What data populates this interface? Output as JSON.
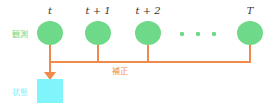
{
  "diagram": {
    "observation_label": "観測",
    "correction_label": "補正",
    "state_label": "状態",
    "time_steps": [
      "t",
      "t + 1",
      "t + 2",
      "T"
    ],
    "ellipsis": "• • •",
    "colors": {
      "observation_node": "#6fd98a",
      "connector": "#f08a4b",
      "state_box": "#80f4fb",
      "observation_text": "#6fd98a",
      "correction_text": "#f08a4b",
      "state_text": "#80f4fb"
    }
  }
}
